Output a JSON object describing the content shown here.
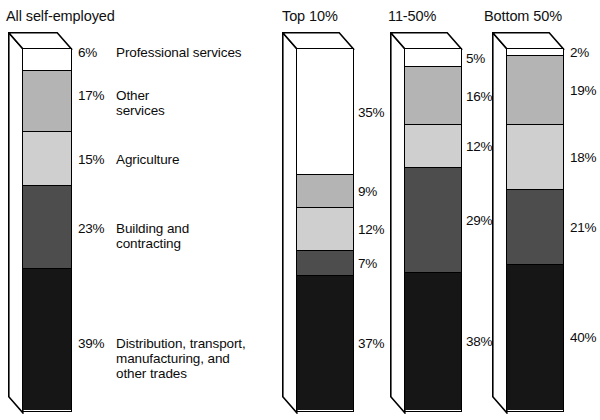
{
  "chart_data": {
    "type": "bar",
    "title": "",
    "subtitle": "",
    "xlabel": "",
    "ylabel": "",
    "ylim": [
      0,
      100
    ],
    "grid": false,
    "legend_position": "inline-right-of-first-bar",
    "stacked": true,
    "units": "%",
    "categories": [
      "All self-employed",
      "Top 10%",
      "11-50%",
      "Bottom 50%"
    ],
    "series": [
      {
        "name": "Professional services",
        "color": "#ffffff",
        "values": [
          6,
          35,
          5,
          2
        ],
        "labels": [
          "6%",
          "35%",
          "5%",
          "2%"
        ]
      },
      {
        "name": "Other services",
        "color": "#b4b4b4",
        "values": [
          17,
          9,
          16,
          19
        ],
        "labels": [
          "17%",
          "9%",
          "16%",
          "19%"
        ]
      },
      {
        "name": "Agriculture",
        "color": "#cfcfcf",
        "values": [
          15,
          12,
          12,
          18
        ],
        "labels": [
          "15%",
          "12%",
          "12%",
          "18%"
        ]
      },
      {
        "name": "Building and contracting",
        "color": "#4d4d4d",
        "values": [
          23,
          7,
          29,
          21
        ],
        "labels": [
          "23%",
          "7%",
          "29%",
          "21%"
        ]
      },
      {
        "name": "Distribution, transport, manufacturing, and other trades",
        "color": "#161616",
        "values": [
          39,
          37,
          38,
          40
        ],
        "labels": [
          "39%",
          "37%",
          "38%",
          "40%"
        ]
      }
    ]
  },
  "columns": [
    {
      "id": "all-self-employed",
      "title": "All self-employed",
      "segments": [
        {
          "label": "6%",
          "name": "Professional services",
          "value": 6,
          "color": "#ffffff"
        },
        {
          "label": "17%",
          "name": "Other\nservices",
          "value": 17,
          "color": "#b4b4b4"
        },
        {
          "label": "15%",
          "name": "Agriculture",
          "value": 15,
          "color": "#cfcfcf"
        },
        {
          "label": "23%",
          "name": "Building and\ncontracting",
          "value": 23,
          "color": "#4d4d4d"
        },
        {
          "label": "39%",
          "name": "Distribution, transport,\nmanufacturing, and\nother trades",
          "value": 39,
          "color": "#161616"
        }
      ]
    },
    {
      "id": "top-10",
      "title": "Top 10%",
      "segments": [
        {
          "label": "35%",
          "name": "Professional services",
          "value": 35,
          "color": "#ffffff"
        },
        {
          "label": "9%",
          "name": "Other services",
          "value": 9,
          "color": "#b4b4b4"
        },
        {
          "label": "12%",
          "name": "Agriculture",
          "value": 12,
          "color": "#cfcfcf"
        },
        {
          "label": "7%",
          "name": "Building and contracting",
          "value": 7,
          "color": "#4d4d4d"
        },
        {
          "label": "37%",
          "name": "Distribution, transport, manufacturing, and other trades",
          "value": 37,
          "color": "#161616"
        }
      ]
    },
    {
      "id": "11-50",
      "title": "11-50%",
      "segments": [
        {
          "label": "5%",
          "name": "Professional services",
          "value": 5,
          "color": "#ffffff"
        },
        {
          "label": "16%",
          "name": "Other services",
          "value": 16,
          "color": "#b4b4b4"
        },
        {
          "label": "12%",
          "name": "Agriculture",
          "value": 12,
          "color": "#cfcfcf"
        },
        {
          "label": "29%",
          "name": "Building and contracting",
          "value": 29,
          "color": "#4d4d4d"
        },
        {
          "label": "38%",
          "name": "Distribution, transport, manufacturing, and other trades",
          "value": 38,
          "color": "#161616"
        }
      ]
    },
    {
      "id": "bottom-50",
      "title": "Bottom 50%",
      "segments": [
        {
          "label": "2%",
          "name": "Professional services",
          "value": 2,
          "color": "#ffffff"
        },
        {
          "label": "19%",
          "name": "Other services",
          "value": 19,
          "color": "#b4b4b4"
        },
        {
          "label": "18%",
          "name": "Agriculture",
          "value": 18,
          "color": "#cfcfcf"
        },
        {
          "label": "21%",
          "name": "Building and contracting",
          "value": 21,
          "color": "#4d4d4d"
        },
        {
          "label": "40%",
          "name": "Distribution, transport, manufacturing, and other trades",
          "value": 40,
          "color": "#161616"
        }
      ]
    }
  ],
  "palette": {
    "outline": "#000000",
    "professional_services": "#ffffff",
    "other_services": "#b4b4b4",
    "agriculture": "#cfcfcf",
    "building_contracting": "#4d4d4d",
    "distribution_trades": "#161616",
    "background": "#ffffff"
  }
}
